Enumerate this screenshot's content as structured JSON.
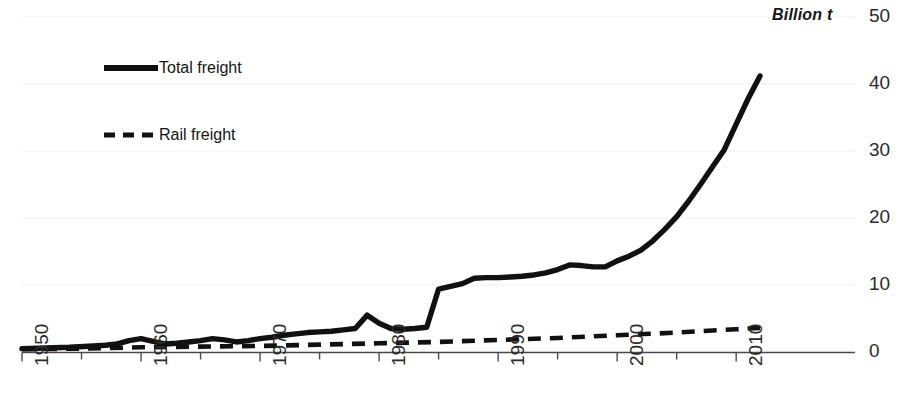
{
  "chart_data": {
    "type": "line",
    "title": "",
    "subtitle": "",
    "xlabel": "",
    "ylabel": "Billion t",
    "y_unit_label": "Billion t",
    "xlim": [
      1950,
      2012
    ],
    "ylim": [
      0,
      50
    ],
    "y_ticks": [
      0,
      10,
      20,
      30,
      40,
      50
    ],
    "y_tick_labels": [
      "0",
      "10",
      "20",
      "30",
      "40",
      "50"
    ],
    "x_ticks": [
      1950,
      1960,
      1970,
      1980,
      1990,
      2000,
      2010
    ],
    "x_tick_labels": [
      "1950",
      "1960",
      "1970",
      "1980",
      "1990",
      "2000",
      "2010"
    ],
    "x_minor_tick_interval": 5,
    "grid": "faint-horizontal",
    "legend_position": "upper-left-inside",
    "legend": [
      {
        "name": "Total freight",
        "style": "solid",
        "color": "#111111",
        "width": 5
      },
      {
        "name": "Rail freight",
        "style": "dashed",
        "color": "#111111",
        "width": 4
      }
    ],
    "series": [
      {
        "name": "Total freight",
        "style": "solid",
        "color": "#111111",
        "x": [
          1950,
          1952,
          1954,
          1956,
          1957,
          1958,
          1959,
          1960,
          1961,
          1962,
          1963,
          1964,
          1965,
          1966,
          1967,
          1968,
          1969,
          1970,
          1971,
          1972,
          1973,
          1974,
          1975,
          1976,
          1977,
          1978,
          1979,
          1980,
          1981,
          1982,
          1983,
          1984,
          1985,
          1986,
          1987,
          1988,
          1989,
          1990,
          1991,
          1992,
          1993,
          1994,
          1995,
          1996,
          1997,
          1998,
          1999,
          2000,
          2001,
          2002,
          2003,
          2004,
          2005,
          2006,
          2007,
          2008,
          2009,
          2010,
          2011,
          2012
        ],
        "y": [
          0.5,
          0.6,
          0.7,
          0.9,
          1.0,
          1.2,
          1.7,
          2.0,
          1.6,
          1.2,
          1.3,
          1.5,
          1.7,
          2.0,
          1.8,
          1.5,
          1.7,
          2.0,
          2.2,
          2.5,
          2.7,
          2.9,
          3.0,
          3.1,
          3.3,
          3.5,
          5.5,
          4.3,
          3.5,
          3.4,
          3.5,
          3.7,
          9.4,
          9.8,
          10.2,
          11.0,
          11.1,
          11.1,
          11.2,
          11.3,
          11.5,
          11.8,
          12.3,
          13.0,
          12.9,
          12.7,
          12.7,
          13.6,
          14.3,
          15.2,
          16.6,
          18.3,
          20.2,
          22.5,
          25.0,
          27.6,
          30.2,
          34.0,
          37.8,
          41.2
        ]
      },
      {
        "name": "Rail freight",
        "style": "dashed",
        "color": "#111111",
        "x": [
          1950,
          1955,
          1960,
          1965,
          1970,
          1975,
          1980,
          1985,
          1990,
          1995,
          2000,
          2005,
          2010,
          2012
        ],
        "y": [
          0.4,
          0.5,
          0.7,
          0.8,
          0.9,
          1.1,
          1.3,
          1.5,
          1.8,
          2.1,
          2.5,
          2.9,
          3.4,
          3.6
        ]
      }
    ]
  },
  "axis": {
    "unit_label": "Billion t"
  }
}
